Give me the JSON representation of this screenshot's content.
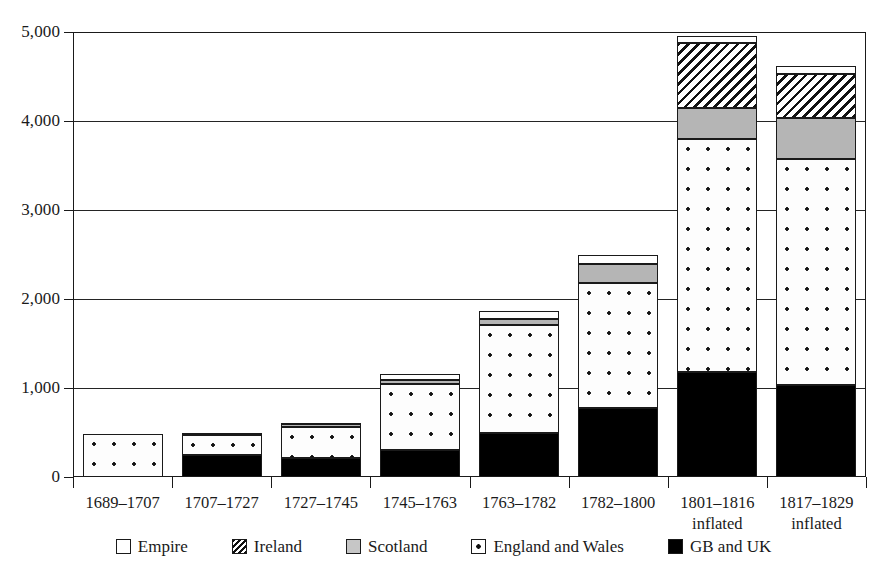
{
  "chart_data": {
    "type": "bar",
    "subtype": "stacked",
    "title": "",
    "xlabel": "",
    "ylabel": "",
    "ylim": [
      0,
      5000
    ],
    "yticks": [
      0,
      1000,
      2000,
      3000,
      4000,
      5000
    ],
    "ytick_labels": [
      "0",
      "1,000",
      "2,000",
      "3,000",
      "4,000",
      "5,000"
    ],
    "grid": true,
    "grid_axis": "y",
    "legend_position": "bottom",
    "categories": [
      "1689–1707",
      "1707–1727",
      "1727–1745",
      "1745–1763",
      "1763–1782",
      "1782–1800",
      "1801–1816",
      "1817–1829"
    ],
    "category_sublabels": [
      "",
      "",
      "",
      "",
      "",
      "",
      "inflated",
      "inflated"
    ],
    "series": [
      {
        "name": "GB and UK",
        "pattern": "solid-black",
        "color": "#000000",
        "values": [
          0,
          250,
          215,
          300,
          490,
          780,
          1180,
          1030
        ]
      },
      {
        "name": "England and Wales",
        "pattern": "dotted",
        "color": "#ffffff",
        "values": [
          480,
          225,
          350,
          750,
          1220,
          1400,
          2620,
          2540
        ]
      },
      {
        "name": "Scotland",
        "pattern": "solid-gray",
        "color": "#b5b5b5",
        "values": [
          0,
          20,
          25,
          40,
          60,
          210,
          350,
          460
        ]
      },
      {
        "name": "Ireland",
        "pattern": "diagonal-hatch",
        "color": "#ffffff",
        "values": [
          0,
          0,
          0,
          0,
          0,
          0,
          730,
          500
        ]
      },
      {
        "name": "Empire",
        "pattern": "solid-white",
        "color": "#ffffff",
        "values": [
          0,
          0,
          20,
          65,
          100,
          110,
          80,
          90
        ]
      }
    ],
    "totals": [
      480,
      495,
      610,
      1155,
      1870,
      2500,
      4960,
      4620
    ]
  },
  "legend": {
    "items": [
      {
        "label": "Empire",
        "swatch": "empire",
        "icon": "legend-swatch-empire"
      },
      {
        "label": "Ireland",
        "swatch": "ireland",
        "icon": "legend-swatch-ireland"
      },
      {
        "label": "Scotland",
        "swatch": "scotland",
        "icon": "legend-swatch-scotland"
      },
      {
        "label": "England and Wales",
        "swatch": "engwales",
        "icon": "legend-swatch-england-and-wales"
      },
      {
        "label": "GB and UK",
        "swatch": "gbuk",
        "icon": "legend-swatch-gb-and-uk"
      }
    ]
  }
}
